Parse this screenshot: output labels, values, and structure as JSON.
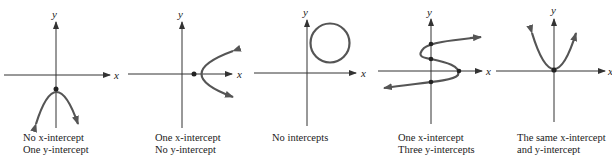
{
  "figure": {
    "axis_labels": {
      "x": "x",
      "y": "y"
    },
    "panels": [
      {
        "id": "downward-parabola",
        "caption_lines": [
          "No x-intercept",
          "One y-intercept"
        ]
      },
      {
        "id": "sideways-parabola",
        "caption_lines": [
          "One x-intercept",
          "No y-intercept"
        ]
      },
      {
        "id": "circle",
        "caption_lines": [
          "No intercepts"
        ]
      },
      {
        "id": "s-curve",
        "caption_lines": [
          "One x-intercept",
          "Three y-intercepts"
        ]
      },
      {
        "id": "upward-parabola",
        "caption_lines": [
          "The same x-intercept",
          "and y-intercept"
        ]
      }
    ],
    "colors": {
      "curve": "#555555",
      "axis": "#333333",
      "point": "#222222"
    }
  }
}
